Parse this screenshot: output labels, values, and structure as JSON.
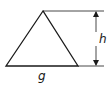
{
  "diagram": {
    "type": "triangle-dimension",
    "labels": {
      "base": "g",
      "height": "h"
    },
    "stroke_color": "#1a1a1a",
    "background": "#ffffff"
  }
}
